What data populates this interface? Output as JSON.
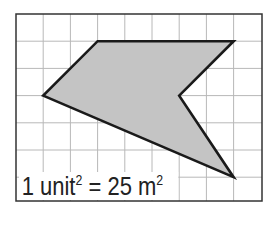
{
  "diagram": {
    "type": "grid-polygon",
    "grid": {
      "columns": 9,
      "rows": 7,
      "cell_px": 27.2,
      "origin_px": [
        16,
        14
      ]
    },
    "polygon_vertices_grid": [
      [
        3,
        1
      ],
      [
        8,
        1
      ],
      [
        6,
        3
      ],
      [
        8,
        6
      ],
      [
        1,
        3
      ]
    ],
    "colors": {
      "fill": "#c4c4c4",
      "stroke": "#1a1a1a",
      "grid": "#b8b8b8",
      "border": "#333333"
    }
  },
  "scale_label": {
    "prefix": "1 unit",
    "exp1": "2",
    "middle": " = 25 m",
    "exp2": "2"
  }
}
